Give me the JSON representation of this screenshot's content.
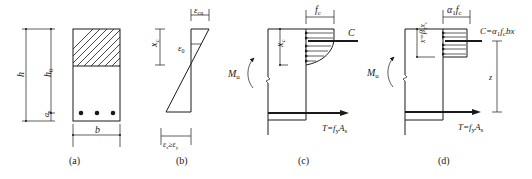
{
  "figure": {
    "panels": [
      {
        "id": "a",
        "caption": "(a)",
        "title": "Cross-section",
        "labels": {
          "h": "h",
          "h0": "h",
          "h0_sub": "0",
          "as": "a",
          "as_sub": "s",
          "b": "b"
        },
        "reinforcement_bars": 3
      },
      {
        "id": "b",
        "caption": "(b)",
        "title": "Strain distribution",
        "labels": {
          "ecu": "ε",
          "ecu_sub": "cu",
          "e0": "ε",
          "e0_sub": "0",
          "xc": "x",
          "xc_sub": "c",
          "es_cond": "ε",
          "es_cond_sub": "s",
          "es_cond_rel": "≥ε",
          "es_cond_sub2": "y"
        }
      },
      {
        "id": "c",
        "caption": "(c)",
        "title": "Actual stress distribution",
        "labels": {
          "fc": "f",
          "fc_sub": "c",
          "C": "C",
          "xc": "x",
          "xc_sub": "c",
          "Mu": "M",
          "Mu_sub": "u",
          "T": "T=f",
          "T_sub": "y",
          "T_tail": "A",
          "T_tail_sub": "s"
        }
      },
      {
        "id": "d",
        "caption": "(d)",
        "title": "Equivalent rectangular stress block",
        "labels": {
          "a1fc": "α",
          "a1fc_sub": "1",
          "a1fc_tail": "f",
          "a1fc_tail_sub": "c",
          "C": "C=α",
          "C_sub": "1",
          "C_mid": "f",
          "C_mid_sub": "c",
          "C_tail": "bx",
          "x": "x=β",
          "x_sub": "1",
          "x_tail": "x",
          "x_tail_sub": "c",
          "z": "z",
          "Mu": "M",
          "Mu_sub": "u",
          "T": "T=f",
          "T_sub": "y",
          "T_tail": "A",
          "T_tail_sub": "s"
        }
      }
    ],
    "colors": {
      "ink": "#1a1a1a",
      "background": "#ffffff"
    }
  }
}
